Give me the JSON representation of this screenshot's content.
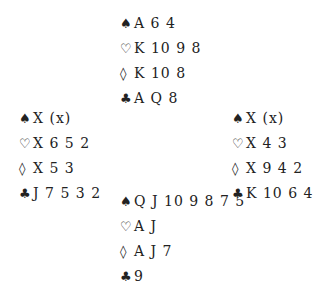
{
  "hands": {
    "north": {
      "spades": "A 6 4",
      "hearts": "K 10 9 8",
      "diamonds": "K 10 8",
      "clubs": "A Q 8"
    },
    "west": {
      "spades": "X (x)",
      "hearts": "X 6 5 2",
      "diamonds": "X 5 3",
      "clubs": "J 7 5 3 2"
    },
    "east": {
      "spades": "X (x)",
      "hearts": "X 4 3",
      "diamonds": "X 9 4 2",
      "clubs": "K 10 6 4"
    },
    "south": {
      "spades": "Q J 10 9 8 7 5",
      "hearts": "A J",
      "diamonds": "A J 7",
      "clubs": "9"
    }
  },
  "suit_symbols": {
    "spades": "♠",
    "hearts": "♡",
    "diamonds": "◊",
    "clubs": "♣"
  }
}
